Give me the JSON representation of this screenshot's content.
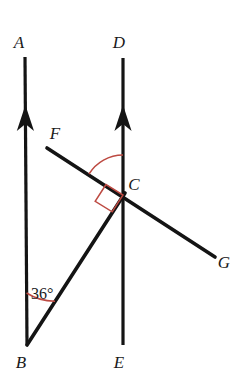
{
  "figure": {
    "background_color": "#ffffff",
    "line_color": "#141414",
    "marker_color": "#bd4a42",
    "label_color": "#1a1a1a",
    "width": 252,
    "height": 376
  },
  "points": {
    "A": {
      "label": "A",
      "x": 25,
      "y": 57,
      "label_x": 19,
      "label_y": 48
    },
    "B": {
      "label": "B",
      "x": 27,
      "y": 345,
      "label_x": 21,
      "label_y": 368
    },
    "C": {
      "label": "C",
      "x": 123,
      "y": 195,
      "label_x": 130,
      "label_y": 190
    },
    "D": {
      "label": "D",
      "x": 123,
      "y": 58,
      "label_x": 117,
      "label_y": 48
    },
    "E": {
      "label": "E",
      "x": 123,
      "y": 345,
      "label_x": 117,
      "label_y": 368
    },
    "F": {
      "label": "F",
      "x": 47,
      "y": 148,
      "label_x": 50,
      "label_y": 138
    },
    "G": {
      "label": "G",
      "x": 215,
      "y": 257,
      "label_x": 218,
      "label_y": 268
    }
  },
  "segments": [
    {
      "name": "ray-ba",
      "from": "B",
      "to": "A",
      "arrow": true,
      "arrow_at_y": 118
    },
    {
      "name": "ray-ed",
      "from": "E",
      "to": "D",
      "arrow": true,
      "arrow_at_y": 118
    },
    {
      "name": "line-fg",
      "from": "F",
      "to": "G",
      "arrow": false
    },
    {
      "name": "segment-bc",
      "from": "B",
      "to": "C",
      "arrow": false
    }
  ],
  "markers": {
    "angle_b": {
      "name": "angle-36-arc",
      "value": "36",
      "unit": "°",
      "label": "36°",
      "label_x": 30,
      "label_y": 298,
      "arc_radius": 52,
      "color": "#bd4a42"
    },
    "angle_c_arc": {
      "name": "angle-fcd-arc",
      "vertex": "C",
      "arc_radius": 40,
      "color": "#bd4a42"
    },
    "right_angle_c": {
      "name": "right-angle-fcb",
      "vertex": "C",
      "size": 20,
      "color": "#bd4a42"
    }
  }
}
